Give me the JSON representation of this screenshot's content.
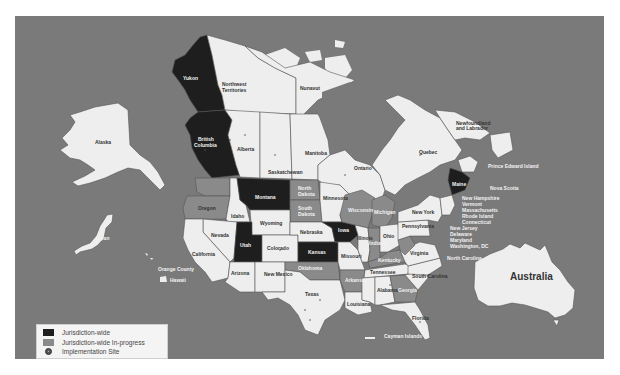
{
  "map": {
    "colors": {
      "ocean": "#7a7a7a",
      "land": "#eeeeee",
      "jurisdiction_wide": "#1e1e1e",
      "in_progress": "#8a8a8a",
      "border": "#555555"
    },
    "labels": {
      "yukon": "Yukon",
      "northwest_territories_1": "Northwest",
      "northwest_territories_2": "Territories",
      "nunavut": "Nunavut",
      "alaska": "Alaska",
      "british_columbia_1": "British",
      "british_columbia_2": "Columbia",
      "alberta": "Alberta",
      "saskatchewan": "Saskatchewan",
      "manitoba": "Manitoba",
      "ontario": "Ontario",
      "quebec": "Quebec",
      "newfoundland_1": "Newfoundland",
      "newfoundland_2": "and Labrador",
      "pei": "Prince Edward Island",
      "new_brunswick": "N.B.",
      "nova_scotia": "Nova Scotia",
      "maine": "Maine",
      "northeast_1": "New Hampshire",
      "northeast_2": "Vermont",
      "northeast_3": "Massachusetts",
      "northeast_4": "Rhode Island",
      "northeast_5": "Connecticut",
      "midatlantic_1": "New Jersey",
      "midatlantic_2": "Delaware",
      "midatlantic_3": "Maryland",
      "midatlantic_4": "Washington, DC",
      "north_carolina": "North Carolina",
      "japan": "Japan",
      "orange_county": "Orange County",
      "hawaii": "Hawaii",
      "oregon": "Oregon",
      "washington": "Washington",
      "idaho": "Idaho",
      "montana": "Montana",
      "wyoming": "Wyoming",
      "nevada": "Nevada",
      "california": "California",
      "utah": "Utah",
      "colorado": "Colorado",
      "arizona": "Arizona",
      "new_mexico": "New Mexico",
      "north_dakota_1": "North",
      "north_dakota_2": "Dakota",
      "south_dakota_1": "South",
      "south_dakota_2": "Dakota",
      "nebraska": "Nebraska",
      "kansas": "Kansas",
      "oklahoma": "Oklahoma",
      "texas": "Texas",
      "minnesota": "Minnesota",
      "iowa": "Iowa",
      "missouri": "Missouri",
      "arkansas": "Arkansas",
      "louisiana": "Louisiana",
      "wisconsin": "Wisconsin",
      "michigan": "Michigan",
      "illinois": "Illinois",
      "indiana": "Indiana",
      "ohio": "Ohio",
      "kentucky": "Kentucky",
      "tennessee": "Tennessee",
      "mississippi": "Mississippi",
      "alabama": "Alabama",
      "georgia": "Georgia",
      "florida": "Florida",
      "south_carolina": "South Carolina",
      "virginia": "Virginia",
      "west_virginia": "W.V.",
      "pennsylvania": "Pennsylvania",
      "new_york": "New York",
      "cayman": "Cayman Islands",
      "australia": "Australia"
    }
  },
  "legend": {
    "items": [
      {
        "label": "Jurisdiction-wide",
        "type": "swatch",
        "color": "#1e1e1e"
      },
      {
        "label": "Jurisdiction-wide In-progress",
        "type": "swatch",
        "color": "#8a8a8a"
      },
      {
        "label": "Implementation Site",
        "type": "dot",
        "color": "#555555"
      }
    ]
  }
}
